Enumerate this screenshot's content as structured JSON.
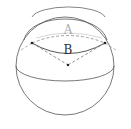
{
  "diagram": {
    "type": "sphere-geometry",
    "labels": {
      "arc_upper": "A",
      "arc_lower": "B"
    },
    "colors": {
      "stroke": "#555555",
      "dashed": "#777777",
      "label_a": "#aaaaaa",
      "label_b": "#333333",
      "background": "#ffffff"
    }
  }
}
